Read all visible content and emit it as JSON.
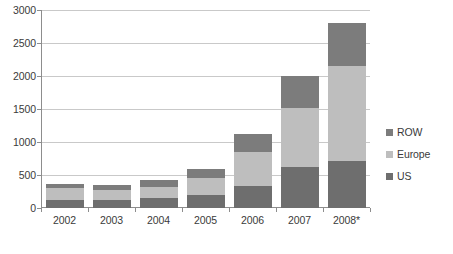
{
  "chart_data": {
    "type": "bar",
    "stacked": true,
    "title": "",
    "subtitle": "",
    "xlabel": "",
    "ylabel": "",
    "grid": true,
    "legend_position": "right",
    "ylim": [
      0,
      3000
    ],
    "yticks": [
      0,
      500,
      1000,
      1500,
      2000,
      2500,
      3000
    ],
    "ytick_labels": [
      "0",
      "500",
      "1000",
      "1500",
      "2000",
      "2500",
      "3000"
    ],
    "categories": [
      "2002",
      "2003",
      "2004",
      "2005",
      "2006",
      "2007",
      "2008*"
    ],
    "series": [
      {
        "name": "US",
        "color": "#6e6e6e",
        "values": [
          125,
          120,
          150,
          190,
          340,
          620,
          710
        ]
      },
      {
        "name": "Europe",
        "color": "#bebebe",
        "values": [
          175,
          160,
          170,
          260,
          510,
          900,
          1440
        ]
      },
      {
        "name": "ROW",
        "color": "#7c7c7c",
        "values": [
          60,
          65,
          110,
          140,
          270,
          480,
          660
        ]
      }
    ],
    "totals": [
      360,
      345,
      430,
      590,
      1120,
      2000,
      2810
    ],
    "legend_entries": [
      "ROW",
      "Europe",
      "US"
    ]
  },
  "legend": {
    "items": [
      {
        "label": "ROW",
        "color": "#7c7c7c"
      },
      {
        "label": "Europe",
        "color": "#bebebe"
      },
      {
        "label": "US",
        "color": "#6e6e6e"
      }
    ]
  },
  "axes": {
    "y_labels": [
      "3000",
      "2500",
      "2000",
      "1500",
      "1000",
      "500",
      "0"
    ],
    "x_labels": [
      "2002",
      "2003",
      "2004",
      "2005",
      "2006",
      "2007",
      "2008*"
    ]
  },
  "caption": {
    "remnant": ""
  }
}
